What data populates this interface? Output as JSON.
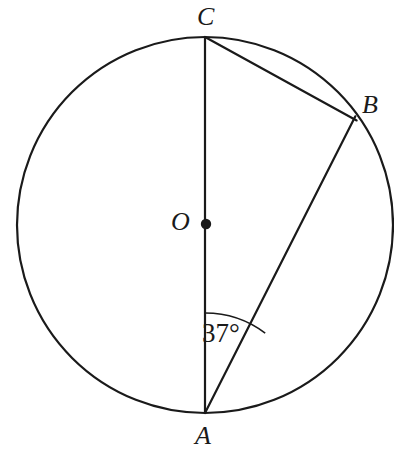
{
  "figure": {
    "background_color": "#ffffff",
    "stroke_color": "#1a1a1a",
    "stroke_width": 2.2
  },
  "circle": {
    "name": "circle-O",
    "center": {
      "x": 205,
      "y": 225
    },
    "radius": 188
  },
  "points": [
    {
      "id": "C",
      "label": "C",
      "x": 205,
      "y": 37,
      "on_circle": true,
      "marked": false
    },
    {
      "id": "B",
      "label": "B",
      "x": 354,
      "y": 119,
      "on_circle": true,
      "marked": false
    },
    {
      "id": "O",
      "label": "O",
      "x": 205,
      "y": 225,
      "on_circle": false,
      "marked": true
    },
    {
      "id": "A",
      "label": "A",
      "x": 205,
      "y": 413,
      "on_circle": true,
      "marked": false
    }
  ],
  "segments": [
    {
      "id": "CA",
      "from": "C",
      "to": "A",
      "kind": "diameter"
    },
    {
      "id": "CB",
      "from": "C",
      "to": "B",
      "kind": "chord"
    },
    {
      "id": "AB",
      "from": "A",
      "to": "B",
      "kind": "chord"
    }
  ],
  "angles": [
    {
      "id": "angle-CAB",
      "vertex": "A",
      "rays": [
        "A-C",
        "A-B"
      ],
      "value": "37°",
      "measure_degrees": 37,
      "arc_radius": 100
    }
  ],
  "labels": {
    "C": "C",
    "B": "B",
    "O": "O",
    "A": "A",
    "angle_CAB": "37°"
  }
}
